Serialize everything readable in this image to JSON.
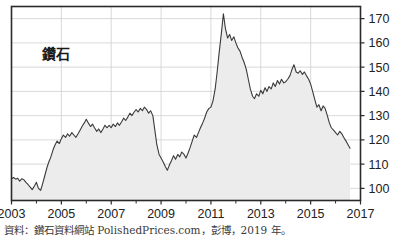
{
  "chart_data": {
    "type": "area",
    "title": "",
    "series_label": "鑽石",
    "xlabel": "",
    "ylabel": "",
    "xlim": [
      2003,
      2017
    ],
    "ylim": [
      95,
      175
    ],
    "grid": true,
    "legend_position": "inside-top-left",
    "y_ticks": [
      100,
      110,
      120,
      130,
      140,
      150,
      160,
      170
    ],
    "x_ticks": [
      2003,
      2005,
      2007,
      2009,
      2011,
      2013,
      2015,
      2017
    ],
    "x_minor_ticks": [
      2004,
      2006,
      2008,
      2010,
      2012,
      2014,
      2016
    ],
    "axis_color": "#2b2b2b",
    "grid_color": "#cfcfcf",
    "line_color": "#3a3a3a",
    "fill_color": "#ececec",
    "x": [
      2003.0,
      2003.08,
      2003.17,
      2003.25,
      2003.33,
      2003.42,
      2003.5,
      2003.58,
      2003.67,
      2003.75,
      2003.83,
      2003.92,
      2004.0,
      2004.08,
      2004.17,
      2004.25,
      2004.33,
      2004.42,
      2004.5,
      2004.58,
      2004.67,
      2004.75,
      2004.83,
      2004.92,
      2005.0,
      2005.08,
      2005.17,
      2005.25,
      2005.33,
      2005.42,
      2005.5,
      2005.58,
      2005.67,
      2005.75,
      2005.83,
      2005.92,
      2006.0,
      2006.08,
      2006.17,
      2006.25,
      2006.33,
      2006.42,
      2006.5,
      2006.58,
      2006.67,
      2006.75,
      2006.83,
      2006.92,
      2007.0,
      2007.08,
      2007.17,
      2007.25,
      2007.33,
      2007.42,
      2007.5,
      2007.58,
      2007.67,
      2007.75,
      2007.83,
      2007.92,
      2008.0,
      2008.08,
      2008.17,
      2008.25,
      2008.33,
      2008.42,
      2008.5,
      2008.58,
      2008.67,
      2008.75,
      2008.83,
      2008.92,
      2009.0,
      2009.08,
      2009.17,
      2009.25,
      2009.33,
      2009.42,
      2009.5,
      2009.58,
      2009.67,
      2009.75,
      2009.83,
      2009.92,
      2010.0,
      2010.08,
      2010.17,
      2010.25,
      2010.33,
      2010.42,
      2010.5,
      2010.58,
      2010.67,
      2010.75,
      2010.83,
      2010.92,
      2011.0,
      2011.08,
      2011.17,
      2011.25,
      2011.33,
      2011.42,
      2011.5,
      2011.58,
      2011.67,
      2011.75,
      2011.83,
      2011.92,
      2012.0,
      2012.08,
      2012.17,
      2012.25,
      2012.33,
      2012.42,
      2012.5,
      2012.58,
      2012.67,
      2012.75,
      2012.83,
      2012.92,
      2013.0,
      2013.08,
      2013.17,
      2013.25,
      2013.33,
      2013.42,
      2013.5,
      2013.58,
      2013.67,
      2013.75,
      2013.83,
      2013.92,
      2014.0,
      2014.08,
      2014.17,
      2014.25,
      2014.33,
      2014.42,
      2014.5,
      2014.58,
      2014.67,
      2014.75,
      2014.83,
      2014.92,
      2015.0,
      2015.08,
      2015.17,
      2015.25,
      2015.33,
      2015.42,
      2015.5,
      2015.58,
      2015.67,
      2015.75,
      2015.83,
      2015.92,
      2016.0,
      2016.08,
      2016.17,
      2016.25,
      2016.33,
      2016.42,
      2016.5,
      2016.58
    ],
    "values": [
      104.0,
      104.5,
      103.8,
      104.2,
      103.0,
      104.0,
      103.5,
      102.5,
      101.5,
      100.5,
      99.5,
      101.0,
      102.5,
      100.0,
      99.2,
      102.0,
      105.0,
      108.5,
      111.0,
      113.0,
      116.0,
      118.0,
      119.5,
      118.5,
      120.5,
      122.0,
      121.0,
      122.5,
      121.5,
      123.0,
      122.0,
      121.0,
      122.5,
      124.0,
      125.5,
      127.0,
      128.5,
      127.0,
      125.5,
      126.5,
      125.0,
      123.5,
      124.5,
      123.0,
      124.5,
      126.0,
      125.0,
      126.0,
      125.0,
      126.5,
      125.5,
      127.0,
      126.0,
      127.5,
      129.0,
      128.0,
      129.5,
      131.0,
      130.0,
      131.5,
      132.5,
      131.5,
      133.0,
      132.0,
      133.5,
      132.5,
      131.0,
      132.0,
      130.0,
      124.0,
      118.0,
      114.0,
      112.5,
      111.0,
      109.0,
      107.5,
      109.5,
      111.5,
      113.5,
      112.0,
      114.0,
      113.0,
      115.0,
      114.0,
      112.5,
      114.5,
      117.0,
      119.5,
      122.0,
      121.0,
      123.0,
      125.0,
      127.0,
      129.0,
      131.5,
      133.0,
      133.5,
      136.0,
      141.0,
      148.0,
      156.0,
      164.0,
      172.0,
      166.0,
      162.0,
      163.5,
      161.0,
      162.5,
      160.0,
      158.0,
      156.5,
      154.0,
      152.0,
      149.0,
      145.0,
      141.0,
      138.0,
      137.0,
      139.0,
      138.0,
      140.5,
      139.0,
      141.5,
      140.0,
      142.0,
      141.0,
      143.5,
      142.0,
      144.5,
      143.0,
      145.0,
      143.5,
      144.0,
      145.0,
      146.5,
      149.0,
      151.0,
      148.0,
      147.5,
      148.5,
      147.0,
      148.0,
      146.5,
      145.0,
      143.0,
      140.0,
      136.5,
      133.5,
      134.5,
      132.0,
      134.0,
      133.0,
      130.0,
      127.0,
      125.0,
      124.0,
      123.0,
      122.0,
      123.5,
      122.5,
      121.0,
      119.5,
      118.0,
      116.5
    ]
  },
  "source": {
    "note": "資料：鑽石資料網站 PolishedPrices.com，彭博，2019 年。"
  }
}
